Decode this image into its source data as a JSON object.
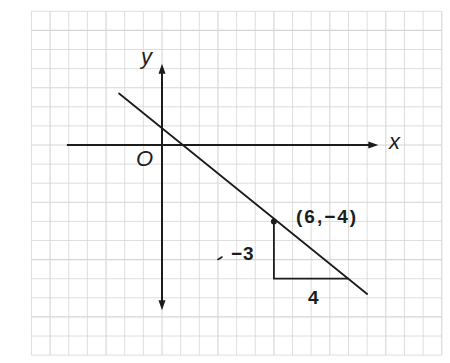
{
  "figure": {
    "labels": {
      "y_axis": "y",
      "x_axis": "x",
      "origin": "O",
      "point": "(6,−4)",
      "rise": "−3",
      "run": "4"
    },
    "colors": {
      "background": "#ffffff",
      "grid": "#d6d6d6",
      "ink": "#1c1c1c"
    }
  },
  "chart_data": {
    "type": "line",
    "title": "",
    "xlabel": "x",
    "ylabel": "y",
    "origin_label": "O",
    "grid": true,
    "grid_range": {
      "x": [
        -7,
        15
      ],
      "y": [
        -11,
        7
      ]
    },
    "axes": {
      "x_axis": {
        "from": -5.1,
        "to": 11.6,
        "arrow_positive": true,
        "arrow_negative": false
      },
      "y_axis": {
        "from": -8.65,
        "to": 4.25,
        "arrow_positive": true,
        "arrow_negative": true
      }
    },
    "line": {
      "slope": -0.75,
      "passes_through": [
        6,
        -4
      ],
      "drawn_segment": {
        "start": [
          -2.3,
          2.7
        ],
        "end": [
          11.0,
          -7.8
        ]
      }
    },
    "points": [
      {
        "x": 6,
        "y": -4,
        "label": "(6,−4)"
      }
    ],
    "slope_triangle": {
      "vertices": [
        [
          6,
          -4
        ],
        [
          6,
          -7
        ],
        [
          10,
          -7
        ]
      ],
      "rise": -3,
      "run": 4,
      "rise_label": "−3",
      "run_label": "4"
    }
  }
}
